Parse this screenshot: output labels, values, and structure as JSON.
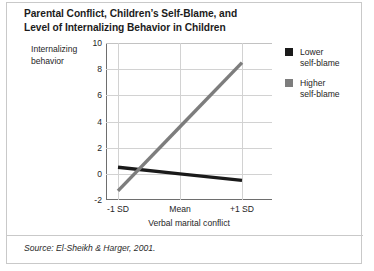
{
  "title": {
    "line1": "Parental Conflict, Children’s Self-Blame, and",
    "line2": "Level of Internalizing Behavior in Children"
  },
  "y_axis_caption": {
    "line1": "Internalizing",
    "line2": "behavior"
  },
  "legend": {
    "items": [
      {
        "label_line1": "Lower",
        "label_line2": "self-blame",
        "color": "#1a1a1a"
      },
      {
        "label_line1": "Higher",
        "label_line2": "self-blame",
        "color": "#7d7d7d"
      }
    ]
  },
  "footer": {
    "source": "Source: El-Sheikh & Harger, 2001."
  },
  "chart_data": {
    "type": "line",
    "title": "Parental Conflict, Children’s Self-Blame, and Level of Internalizing Behavior in Children",
    "xlabel": "Verbal marital conflict",
    "ylabel": "Internalizing behavior",
    "categories": [
      "-1 SD",
      "Mean",
      "+1 SD"
    ],
    "xticklabels": [
      "-1 SD",
      "Mean",
      "+1 SD"
    ],
    "yticklabels": [
      "-2",
      "0",
      "2",
      "4",
      "6",
      "8",
      "10"
    ],
    "yticks": [
      -2,
      0,
      2,
      4,
      6,
      8,
      10
    ],
    "ylim": [
      -2,
      10
    ],
    "grid": "both",
    "legend_position": "right",
    "series": [
      {
        "name": "Lower self-blame",
        "color": "#1a1a1a",
        "values": [
          0.5,
          0.0,
          -0.5
        ]
      },
      {
        "name": "Higher self-blame",
        "color": "#7d7d7d",
        "values": [
          -1.3,
          3.6,
          8.5
        ]
      }
    ]
  }
}
